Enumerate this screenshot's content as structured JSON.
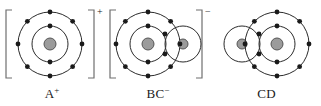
{
  "diagram": {
    "type": "electron-shell-diagram",
    "background_color": "#ffffff",
    "stroke_color": "#2b2b2b",
    "electron_color": "#1a1a1a",
    "nucleus_fill": "#9b9b9b",
    "nucleus_stroke": "#555555",
    "bracket_color": "#6f6f6f",
    "species": [
      {
        "id": "a",
        "caption_text": "A",
        "caption_charge": "+",
        "bracketed": true,
        "bracket_charge": "+",
        "atoms": [
          {
            "label": "A",
            "cx": 50,
            "cy": 44,
            "nucleus_r": 6,
            "shells": [
              {
                "radius": 18,
                "electrons": 2,
                "start_angle": 90
              },
              {
                "radius": 32,
                "electrons": 8,
                "start_angle": 90
              }
            ]
          }
        ]
      },
      {
        "id": "bc",
        "caption_text": "BC",
        "caption_charge": "−",
        "bracketed": true,
        "bracket_charge": "−",
        "atoms": [
          {
            "label": "B",
            "cx": 44,
            "cy": 44,
            "nucleus_r": 6,
            "shells": [
              {
                "radius": 18,
                "electrons": 2,
                "start_angle": 90
              },
              {
                "radius": 32,
                "electrons": 8,
                "start_angle": 90
              }
            ]
          },
          {
            "label": "C",
            "cx": 79,
            "cy": 44,
            "nucleus_r": 5,
            "shells": [
              {
                "radius": 18,
                "electrons": 0,
                "start_angle": 90
              }
            ]
          }
        ],
        "shared_pair": {
          "x": 61,
          "y_top": 34,
          "y_bottom": 54
        }
      },
      {
        "id": "cd",
        "caption_text": "CD",
        "caption_charge": "",
        "bracketed": false,
        "bracket_charge": "",
        "atoms": [
          {
            "label": "C",
            "cx": 30,
            "cy": 44,
            "nucleus_r": 5,
            "shells": [
              {
                "radius": 18,
                "electrons": 0,
                "start_angle": 90
              }
            ]
          },
          {
            "label": "D",
            "cx": 65,
            "cy": 44,
            "nucleus_r": 6,
            "shells": [
              {
                "radius": 18,
                "electrons": 2,
                "start_angle": 90
              },
              {
                "radius": 32,
                "electrons": 8,
                "start_angle": 90
              }
            ]
          }
        ],
        "shared_pair": {
          "x": 47,
          "y_top": 34,
          "y_bottom": 54
        }
      }
    ]
  }
}
